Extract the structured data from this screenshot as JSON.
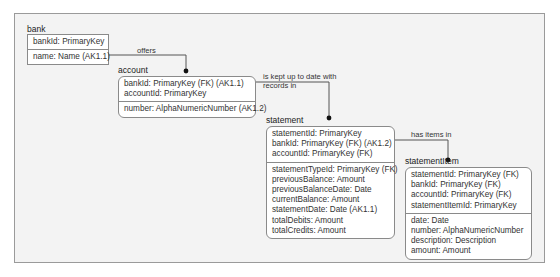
{
  "diagram": {
    "type": "IDEF1X entity-relationship diagram",
    "entities": [
      {
        "name": "bank",
        "key_attributes": [
          "bankId: PrimaryKey"
        ],
        "attributes": [
          "name: Name (AK1.1)"
        ]
      },
      {
        "name": "account",
        "key_attributes": [
          "bankId: PrimaryKey (FK) (AK1.1)",
          "accountId: PrimaryKey"
        ],
        "attributes": [
          "number: AlphaNumericNumber (AK1.2)"
        ]
      },
      {
        "name": "statement",
        "key_attributes": [
          "statementId: PrimaryKey",
          "bankId: PrimaryKey (FK) (AK1.2)",
          "accountId: PrimaryKey (FK)"
        ],
        "attributes": [
          "statementTypeId: PrimaryKey (FK)",
          "previousBalance: Amount",
          "previousBalanceDate: Date",
          "currentBalance: Amount",
          "statementDate: Date (AK1.1)",
          "totalDebits: Amount",
          "totalCredits: Amount"
        ]
      },
      {
        "name": "statementItem",
        "key_attributes": [
          "statementId: PrimaryKey (FK)",
          "bankId: PrimaryKey (FK)",
          "accountId: PrimaryKey (FK)",
          "statementItemId: PrimaryKey"
        ],
        "attributes": [
          "date: Date",
          "number: AlphaNumericNumber",
          "description: Description",
          "amount: Amount"
        ]
      }
    ],
    "relationships": [
      {
        "from": "bank",
        "to": "account",
        "label": "offers"
      },
      {
        "from": "account",
        "to": "statement",
        "label_line1": "is kept up to date with",
        "label_line2": "records in"
      },
      {
        "from": "statement",
        "to": "statementItem",
        "label": "has items in"
      }
    ],
    "colors": {
      "frame_bg": "#f3f3f3",
      "box_border": "#8a8a8a",
      "line": "#555555"
    }
  }
}
